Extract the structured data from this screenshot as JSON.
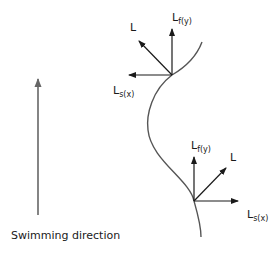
{
  "diagram": {
    "caption": "Swimming direction",
    "colors": {
      "curve": "#555555",
      "arrows": "#1a1a1a",
      "swim_arrow": "#666666",
      "background": "#ffffff"
    },
    "upper_vectors": {
      "lift": {
        "main": "L",
        "sub": ""
      },
      "forward": {
        "main": "L",
        "sub": "f(y)"
      },
      "side": {
        "main": "L",
        "sub": "s(x)"
      }
    },
    "lower_vectors": {
      "lift": {
        "main": "L",
        "sub": ""
      },
      "forward": {
        "main": "L",
        "sub": "f(y)"
      },
      "side": {
        "main": "L",
        "sub": "s(x)"
      }
    }
  }
}
